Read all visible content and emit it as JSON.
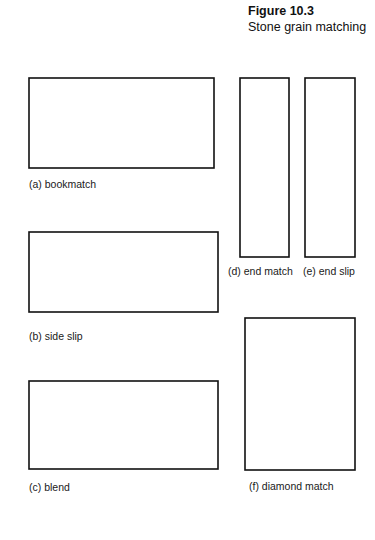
{
  "figure": {
    "number": "Figure 10.3",
    "subtitle": "Stone grain matching",
    "background_color": "#ffffff",
    "line_color": "#111111",
    "grain_color": "#2b2b2b"
  },
  "panels": [
    {
      "id": "a",
      "caption": "(a) bookmatch",
      "pattern": "bookmatch",
      "columns": 4,
      "rows": 1,
      "x": 29,
      "y": 78,
      "width": 185,
      "height": 90,
      "caption_x": 29,
      "caption_y": 178
    },
    {
      "id": "b",
      "caption": "(b) side slip",
      "pattern": "side-slip",
      "columns": 4,
      "rows": 1,
      "x": 29,
      "y": 232,
      "width": 189,
      "height": 80,
      "caption_x": 29,
      "caption_y": 330
    },
    {
      "id": "c",
      "caption": "(c) blend",
      "pattern": "blend",
      "columns": 4,
      "rows": 1,
      "x": 29,
      "y": 381,
      "width": 189,
      "height": 88,
      "caption_x": 29,
      "caption_y": 481
    },
    {
      "id": "d",
      "caption": "(d) end match",
      "pattern": "end-match",
      "columns": 1,
      "rows": 2,
      "x": 240,
      "y": 78,
      "width": 49,
      "height": 179,
      "caption_x": 228,
      "caption_y": 265
    },
    {
      "id": "e",
      "caption": "(e) end slip",
      "pattern": "end-slip",
      "columns": 1,
      "rows": 2,
      "x": 305,
      "y": 78,
      "width": 50,
      "height": 179,
      "caption_x": 303,
      "caption_y": 265
    },
    {
      "id": "f",
      "caption": "(f) diamond match",
      "pattern": "diamond-match",
      "columns": 2,
      "rows": 2,
      "x": 245,
      "y": 318,
      "width": 110,
      "height": 152,
      "caption_x": 249,
      "caption_y": 480
    }
  ],
  "grain_profiles": {
    "tile_a": [
      [
        [
          0.02,
          0.0
        ],
        [
          0.14,
          0.3
        ],
        [
          0.1,
          0.62
        ],
        [
          0.0,
          1.0
        ]
      ],
      [
        [
          0.14,
          0.0
        ],
        [
          0.3,
          0.28
        ],
        [
          0.26,
          0.6
        ],
        [
          0.12,
          1.0
        ]
      ],
      [
        [
          0.3,
          0.0
        ],
        [
          0.46,
          0.26
        ],
        [
          0.42,
          0.58
        ],
        [
          0.26,
          1.0
        ]
      ],
      [
        [
          0.48,
          0.0
        ],
        [
          0.62,
          0.24
        ],
        [
          0.58,
          0.56
        ],
        [
          0.42,
          1.0
        ]
      ],
      [
        [
          0.66,
          0.0
        ],
        [
          0.78,
          0.26
        ],
        [
          0.74,
          0.58
        ],
        [
          0.6,
          1.0
        ]
      ],
      [
        [
          0.82,
          0.0
        ],
        [
          0.92,
          0.3
        ],
        [
          0.9,
          0.62
        ],
        [
          0.8,
          1.0
        ]
      ],
      [
        [
          0.95,
          0.0
        ],
        [
          1.0,
          0.34
        ],
        [
          0.99,
          0.66
        ],
        [
          0.94,
          1.0
        ]
      ]
    ],
    "tile_b": [
      [
        [
          0.02,
          0.0
        ],
        [
          0.26,
          0.26
        ],
        [
          0.3,
          0.58
        ],
        [
          0.1,
          1.0
        ]
      ],
      [
        [
          0.18,
          0.0
        ],
        [
          0.42,
          0.26
        ],
        [
          0.46,
          0.58
        ],
        [
          0.26,
          1.0
        ]
      ],
      [
        [
          0.34,
          0.0
        ],
        [
          0.58,
          0.26
        ],
        [
          0.62,
          0.58
        ],
        [
          0.42,
          1.0
        ]
      ],
      [
        [
          0.5,
          0.0
        ],
        [
          0.74,
          0.26
        ],
        [
          0.78,
          0.58
        ],
        [
          0.58,
          1.0
        ]
      ],
      [
        [
          0.66,
          0.0
        ],
        [
          0.88,
          0.26
        ],
        [
          0.92,
          0.58
        ],
        [
          0.74,
          1.0
        ]
      ],
      [
        [
          0.82,
          0.0
        ],
        [
          1.0,
          0.28
        ],
        [
          1.02,
          0.6
        ],
        [
          0.9,
          1.0
        ]
      ],
      [
        [
          0.96,
          0.0
        ],
        [
          1.1,
          0.3
        ],
        [
          1.12,
          0.62
        ],
        [
          1.02,
          1.0
        ]
      ]
    ],
    "tile_c1": [
      [
        [
          0.04,
          0.0
        ],
        [
          0.1,
          0.34
        ],
        [
          0.06,
          0.66
        ],
        [
          0.0,
          1.0
        ]
      ],
      [
        [
          0.22,
          0.0
        ],
        [
          0.28,
          0.32
        ],
        [
          0.22,
          0.64
        ],
        [
          0.12,
          1.0
        ]
      ],
      [
        [
          0.4,
          0.0
        ],
        [
          0.44,
          0.34
        ],
        [
          0.4,
          0.66
        ],
        [
          0.3,
          1.0
        ]
      ],
      [
        [
          0.56,
          0.0
        ],
        [
          0.6,
          0.36
        ],
        [
          0.58,
          0.68
        ],
        [
          0.5,
          1.0
        ]
      ],
      [
        [
          0.72,
          0.0
        ],
        [
          0.76,
          0.38
        ],
        [
          0.76,
          0.7
        ],
        [
          0.7,
          1.0
        ]
      ],
      [
        [
          0.88,
          0.0
        ],
        [
          0.92,
          0.4
        ],
        [
          0.92,
          0.72
        ],
        [
          0.88,
          1.0
        ]
      ]
    ],
    "tile_c2": [
      [
        [
          0.0,
          0.12
        ],
        [
          0.34,
          0.04
        ],
        [
          0.7,
          0.12
        ],
        [
          1.0,
          0.02
        ]
      ],
      [
        [
          0.0,
          0.32
        ],
        [
          0.32,
          0.2
        ],
        [
          0.68,
          0.3
        ],
        [
          1.0,
          0.2
        ]
      ],
      [
        [
          0.0,
          0.52
        ],
        [
          0.32,
          0.4
        ],
        [
          0.68,
          0.5
        ],
        [
          1.0,
          0.4
        ]
      ],
      [
        [
          0.0,
          0.72
        ],
        [
          0.32,
          0.6
        ],
        [
          0.68,
          0.7
        ],
        [
          1.0,
          0.6
        ]
      ],
      [
        [
          0.0,
          0.92
        ],
        [
          0.32,
          0.8
        ],
        [
          0.68,
          0.9
        ],
        [
          1.0,
          0.8
        ]
      ]
    ],
    "tile_c4": [
      [
        [
          0.18,
          0.0
        ],
        [
          0.26,
          0.3
        ],
        [
          0.2,
          0.62
        ],
        [
          0.1,
          1.0
        ]
      ],
      [
        [
          0.36,
          0.06
        ],
        [
          0.8,
          0.0
        ],
        [
          1.0,
          0.06
        ],
        [
          1.02,
          0.12
        ]
      ],
      [
        [
          0.3,
          0.26
        ],
        [
          0.64,
          0.18
        ],
        [
          1.0,
          0.26
        ],
        [
          1.02,
          0.32
        ]
      ],
      [
        [
          0.28,
          0.48
        ],
        [
          0.62,
          0.4
        ],
        [
          1.0,
          0.48
        ],
        [
          1.02,
          0.54
        ]
      ],
      [
        [
          0.28,
          0.7
        ],
        [
          0.62,
          0.62
        ],
        [
          1.0,
          0.7
        ],
        [
          1.02,
          0.76
        ]
      ],
      [
        [
          0.3,
          0.92
        ],
        [
          0.64,
          0.84
        ],
        [
          1.0,
          0.92
        ],
        [
          1.02,
          0.98
        ]
      ]
    ],
    "tile_f": [
      [
        [
          0.0,
          1.0
        ],
        [
          0.22,
          0.62
        ],
        [
          0.38,
          0.3
        ],
        [
          0.48,
          0.02
        ]
      ],
      [
        [
          0.12,
          1.0
        ],
        [
          0.34,
          0.64
        ],
        [
          0.46,
          0.32
        ],
        [
          0.52,
          0.04
        ]
      ],
      [
        [
          0.3,
          1.0
        ],
        [
          0.46,
          0.66
        ],
        [
          0.52,
          0.34
        ],
        [
          0.56,
          0.06
        ]
      ],
      [
        [
          0.5,
          1.0
        ],
        [
          0.6,
          0.66
        ],
        [
          0.62,
          0.36
        ],
        [
          0.62,
          0.08
        ]
      ],
      [
        [
          0.7,
          1.0
        ],
        [
          0.76,
          0.68
        ],
        [
          0.76,
          0.38
        ],
        [
          0.74,
          0.1
        ]
      ],
      [
        [
          0.9,
          1.0
        ],
        [
          0.92,
          0.7
        ],
        [
          0.92,
          0.4
        ],
        [
          0.9,
          0.12
        ]
      ],
      [
        [
          1.0,
          0.86
        ],
        [
          1.0,
          0.58
        ],
        [
          1.0,
          0.32
        ],
        [
          1.0,
          0.1
        ]
      ]
    ]
  }
}
